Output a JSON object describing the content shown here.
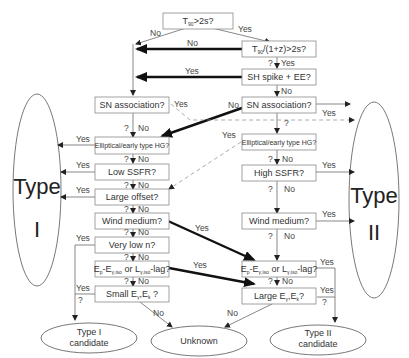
{
  "diagram": {
    "type_ellipses": {
      "left": {
        "line1": "Type",
        "line2": "I"
      },
      "right": {
        "line1": "Type",
        "line2": "II"
      }
    },
    "nodes": {
      "t90": {
        "main": "T",
        "sub": "90",
        "rest": ">2s?"
      },
      "t90z": {
        "main": "T",
        "sub": "90",
        "rest": "/(1+z)>2s?"
      },
      "sh_spike": "SH spike + EE?",
      "sn_left": "SN association?",
      "sn_right": "SN association?",
      "elliptical_left": "Elliptical/early type HG?",
      "elliptical_right": "Elliptical/early type HG?",
      "low_ssfr": "Low SSFR?",
      "high_ssfr": "High SSFR?",
      "large_offset": "Large offset?",
      "wind_left": "Wind medium?",
      "wind_right": "Wind medium?",
      "very_low_n": "Very low n?",
      "lag_left": {
        "p1": "E",
        "s1": "p",
        "p2": "-E",
        "s2": "γ,iso",
        "p3": " or L",
        "s3": "γ,iso",
        "p4": "-lag?"
      },
      "lag_right": {
        "p1": "E",
        "s1": "p",
        "p2": "-E",
        "s2": "γ,iso",
        "p3": " or L",
        "s3": "γ,iso",
        "p4": "-lag?"
      },
      "small_e": {
        "p1": "Small E",
        "s1": "γ",
        "p2": ",E",
        "s2": "k",
        "p3": " ?"
      },
      "large_e": {
        "p1": "Large E",
        "s1": "γ",
        "p2": ",E",
        "s2": "k",
        "p3": "?"
      }
    },
    "outcomes": {
      "type1_candidate": {
        "line1": "Type I",
        "line2": "candidate"
      },
      "unknown": "Unknown",
      "type2_candidate": {
        "line1": "Type II",
        "line2": "candidate"
      }
    },
    "edge_labels": {
      "yes": "Yes",
      "no": "No",
      "q": "?",
      "q_no": "? No",
      "q_yes": "? Yes"
    }
  }
}
